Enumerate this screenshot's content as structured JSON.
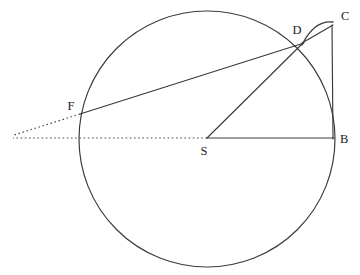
{
  "figure": {
    "background_color": "#ffffff",
    "line_color": "#3a3a3a",
    "label_color": "#1c1c1c",
    "width": 360,
    "height": 275
  },
  "circle": {
    "name": "main-circle",
    "center_x": 207,
    "center_y": 139,
    "radius": 128
  },
  "points": [
    {
      "id": "C",
      "label": "C",
      "x": 332,
      "y": 25,
      "label_x": 341,
      "label_y": 20,
      "on_circle": false
    },
    {
      "id": "D",
      "label": "D",
      "x": 303,
      "y": 43,
      "label_x": 297,
      "label_y": 34,
      "on_circle": true
    },
    {
      "id": "B",
      "label": "B",
      "x": 333,
      "y": 138,
      "label_x": 340,
      "label_y": 143,
      "on_circle": true
    },
    {
      "id": "F",
      "label": "F",
      "x": 80,
      "y": 114,
      "label_x": 71,
      "label_y": 110,
      "on_circle": true
    },
    {
      "id": "S",
      "label": "S",
      "x": 207,
      "y": 139,
      "label_x": 204,
      "label_y": 155,
      "on_circle": false
    }
  ],
  "segments": [
    {
      "id": "FD",
      "name": "segment-f-d",
      "from": "F",
      "to": "D",
      "x1": 80,
      "y1": 114,
      "x2": 304,
      "y2": 43,
      "style": "solid"
    },
    {
      "id": "SD",
      "name": "segment-s-d",
      "from": "S",
      "to": "D",
      "x1": 207,
      "y1": 138,
      "x2": 303,
      "y2": 43,
      "style": "solid"
    },
    {
      "id": "SB",
      "name": "segment-s-b",
      "from": "S",
      "to": "B",
      "x1": 207,
      "y1": 138,
      "x2": 334,
      "y2": 138,
      "style": "solid"
    },
    {
      "id": "DC",
      "name": "segment-d-c",
      "from": "D",
      "to": "C",
      "x1": 302,
      "y1": 43,
      "x2": 333,
      "y2": 25,
      "style": "solid"
    },
    {
      "id": "CB",
      "name": "segment-c-b",
      "from": "C",
      "to": "B",
      "x1": 332,
      "y1": 25,
      "x2": 333,
      "y2": 139,
      "style": "solid"
    }
  ],
  "dotted_extensions": [
    {
      "id": "FD-extension",
      "name": "dotted-extension-secant",
      "x1": 80,
      "y1": 114,
      "x2": 14,
      "y2": 135,
      "style": "dotted"
    },
    {
      "id": "SB-extension",
      "name": "dotted-extension-diameter",
      "x1": 207,
      "y1": 138,
      "x2": 13,
      "y2": 138,
      "style": "dotted"
    }
  ],
  "arcs": [
    {
      "id": "DC-arc",
      "name": "arc-d-to-c",
      "from": "D",
      "to": "C",
      "start_x": 302,
      "start_y": 45,
      "control_x": 314,
      "control_y": 20,
      "end_x": 333,
      "end_y": 22,
      "style": "solid"
    }
  ]
}
